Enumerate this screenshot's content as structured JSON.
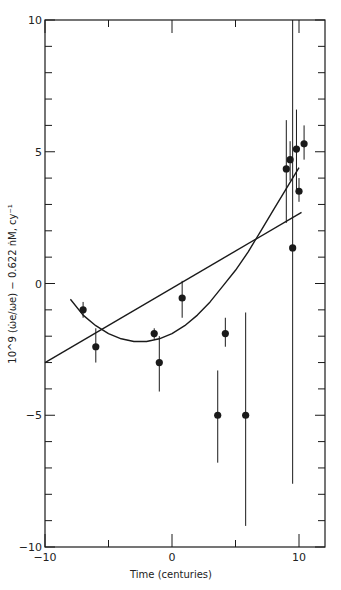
{
  "chart_data": {
    "type": "scatter",
    "title": "",
    "xlabel": "Time (centuries)",
    "ylabel": "10^9 (ω̇e/ωe) − 0.622 ṅM, cy⁻¹",
    "xlim": [
      -10,
      12
    ],
    "ylim": [
      -10,
      10
    ],
    "x_ticks": [
      -10,
      -5,
      0,
      5,
      10
    ],
    "x_tick_labels": [
      "−10",
      "",
      "0",
      "",
      "10"
    ],
    "y_ticks": [
      -10,
      -9,
      -8,
      -7,
      -6,
      -5,
      -4,
      -3,
      -2,
      -1,
      0,
      1,
      2,
      3,
      4,
      5,
      6,
      7,
      8,
      9,
      10
    ],
    "y_tick_labels": {
      "-10": "−10",
      "-5": "−5",
      "0": "0",
      "5": "5",
      "10": "10"
    },
    "grid": false,
    "legend": null,
    "series": [
      {
        "name": "observations",
        "kind": "points_with_error_bars",
        "points": [
          {
            "x": -7.0,
            "y": -1.0,
            "err_low": -1.3,
            "err_high": -0.7
          },
          {
            "x": -6.0,
            "y": -2.4,
            "err_low": -3.0,
            "err_high": -1.7
          },
          {
            "x": -1.4,
            "y": -1.9,
            "err_low": -2.1,
            "err_high": -1.7
          },
          {
            "x": -1.0,
            "y": -3.0,
            "err_low": -4.1,
            "err_high": -2.0
          },
          {
            "x": 0.8,
            "y": -0.55,
            "err_low": -1.3,
            "err_high": 0.1
          },
          {
            "x": 3.6,
            "y": -5.0,
            "err_low": -6.8,
            "err_high": -3.3
          },
          {
            "x": 4.2,
            "y": -1.9,
            "err_low": -2.4,
            "err_high": -1.3
          },
          {
            "x": 5.8,
            "y": -5.0,
            "err_low": -9.2,
            "err_high": -1.1
          },
          {
            "x": 9.0,
            "y": 4.35,
            "err_low": 2.3,
            "err_high": 6.2
          },
          {
            "x": 9.3,
            "y": 4.7,
            "err_low": 3.9,
            "err_high": 5.4
          },
          {
            "x": 9.5,
            "y": 1.35,
            "err_low": -7.6,
            "err_high": 10.0
          },
          {
            "x": 9.8,
            "y": 5.1,
            "err_low": 3.5,
            "err_high": 6.6
          },
          {
            "x": 10.0,
            "y": 3.5,
            "err_low": 3.1,
            "err_high": 4.0
          },
          {
            "x": 10.4,
            "y": 5.3,
            "err_low": 4.7,
            "err_high": 6.0
          }
        ]
      },
      {
        "name": "linear fit",
        "kind": "line",
        "x": [
          -10,
          10.2
        ],
        "y": [
          -3.0,
          2.7
        ]
      },
      {
        "name": "quadratic fit",
        "kind": "curve",
        "x": [
          -8.0,
          -7.0,
          -6.0,
          -5.0,
          -4.0,
          -3.0,
          -2.0,
          -1.0,
          0.0,
          1.0,
          2.0,
          3.0,
          4.0,
          5.0,
          6.0,
          7.0,
          8.0,
          9.0,
          10.0
        ],
        "y": [
          -0.6,
          -1.2,
          -1.6,
          -1.9,
          -2.1,
          -2.2,
          -2.2,
          -2.1,
          -1.9,
          -1.6,
          -1.2,
          -0.7,
          -0.1,
          0.5,
          1.2,
          2.0,
          2.8,
          3.6,
          4.4
        ]
      }
    ]
  }
}
